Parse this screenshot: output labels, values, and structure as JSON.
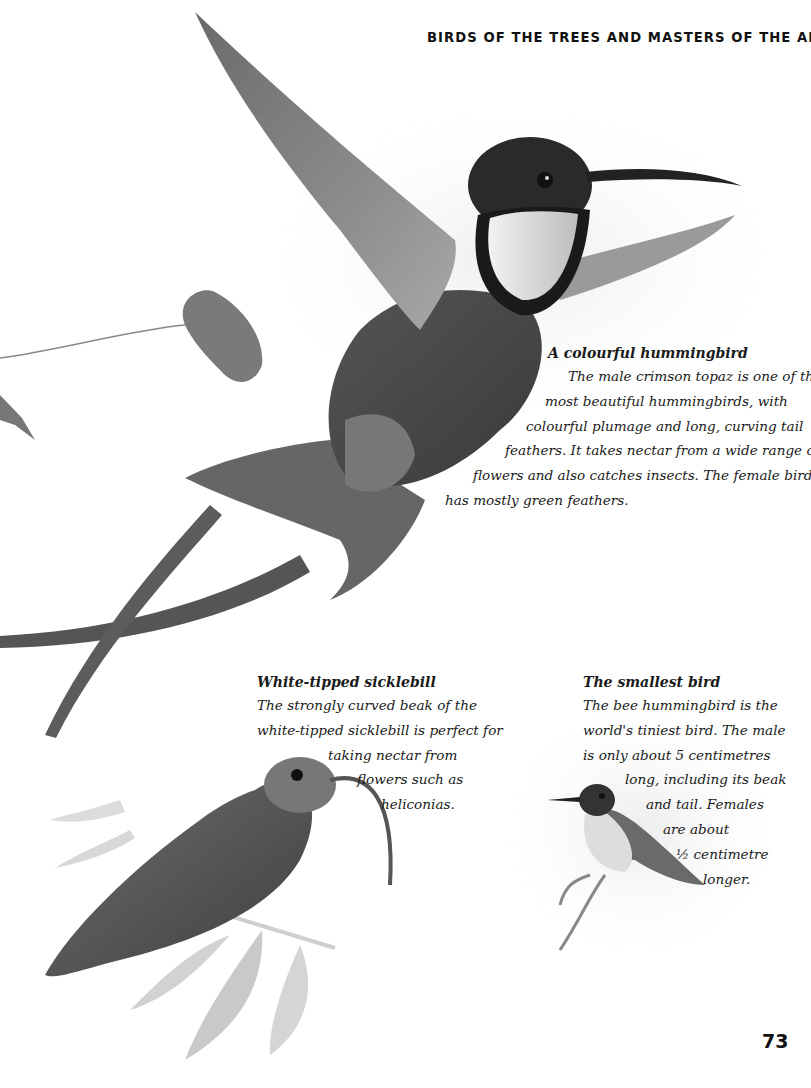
{
  "page": {
    "running_head": "BIRDS OF THE TREES AND MASTERS OF THE AIR",
    "page_number": "73"
  },
  "illustrations": [
    {
      "name": "crimson-topaz-illustration",
      "subject": "male crimson topaz hummingbird in flight"
    },
    {
      "name": "white-tipped-sicklebill-illustration",
      "subject": "white-tipped sicklebill perched on leafy stem"
    },
    {
      "name": "bee-hummingbird-illustration",
      "subject": "bee hummingbird perched on twig"
    },
    {
      "name": "leaf-illustration",
      "subject": "single leaf on thin stem"
    }
  ],
  "colors": {
    "text": "#1a1a1a",
    "plumage_dark": "#3c3c3c",
    "plumage_mid": "#707070",
    "throat_light": "#e8e8e8",
    "foliage_light": "#cfcfcf"
  },
  "captions": {
    "topaz": {
      "title": "A colourful hummingbird",
      "lines": [
        "The male crimson topaz is one of the",
        "most beautiful hummingbirds, with",
        "colourful plumage and long, curving tail",
        "feathers. It takes nectar from a wide range of",
        "flowers and also catches insects. The female bird",
        "has mostly green feathers."
      ]
    },
    "sicklebill": {
      "title": "White-tipped sicklebill",
      "lines": [
        "The strongly curved beak of the",
        "white-tipped sicklebill is perfect for",
        "taking nectar from",
        "flowers such as",
        "heliconias."
      ]
    },
    "bee": {
      "title": "The smallest bird",
      "lines": [
        "The bee hummingbird is the",
        "world's tiniest bird. The male",
        "is only about 5 centimetres",
        "long, including its beak",
        "and tail. Females",
        "are about",
        "½ centimetre",
        "longer."
      ]
    }
  }
}
